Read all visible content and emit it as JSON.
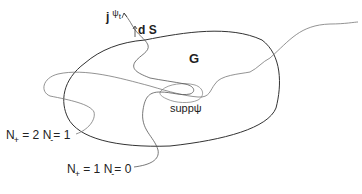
{
  "diagram": {
    "labels": {
      "current": {
        "base": "j",
        "superscript": "ψ",
        "superscript_sub": "t"
      },
      "surface_element": "d S",
      "region": "G",
      "support": "suppψ",
      "path1": {
        "n_plus_label": "N",
        "n_plus_sub": "+",
        "n_plus_value": "= 2",
        "n_minus_label": "N",
        "n_minus_sub": "-",
        "n_minus_value": "= 1"
      },
      "path2": {
        "n_plus_label": "N",
        "n_plus_sub": "+",
        "n_plus_value": "= 1",
        "n_minus_label": "N",
        "n_minus_sub": "-",
        "n_minus_value": "= 0"
      }
    },
    "colors": {
      "region_stroke": "#333333",
      "path_stroke": "#777777",
      "text": "#222222"
    }
  }
}
